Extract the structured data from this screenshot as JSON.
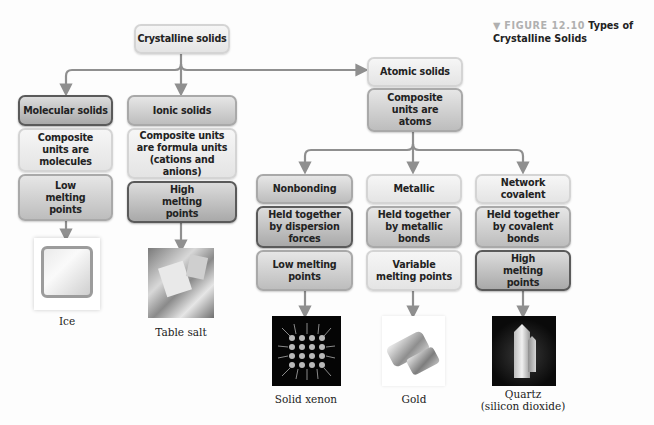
{
  "figure": {
    "marker": "▼",
    "number": "FIGURE 12.10",
    "title_line1": "Types of",
    "title_line2": "Crystalline Solids"
  },
  "root": {
    "label": "Crystalline solids"
  },
  "molecular": {
    "type": "Molecular solids",
    "units": "Composite units are molecules",
    "melting": "Low melting points",
    "example": "Ice"
  },
  "ionic": {
    "type": "Ionic solids",
    "units": "Composite units are formula units (cations and anions)",
    "melting": "High melting points",
    "example": "Table salt"
  },
  "atomic": {
    "type": "Atomic solids",
    "units": "Composite units are atoms",
    "subtypes": [
      {
        "type": "Nonbonding",
        "bond": "Held together by dispersion forces",
        "melting": "Low melting points",
        "example": "Solid xenon"
      },
      {
        "type": "Metallic",
        "bond": "Held together by metallic bonds",
        "melting": "Variable melting points",
        "example": "Gold"
      },
      {
        "type": "Network covalent",
        "bond": "Held together by covalent bonds",
        "melting": "High melting points",
        "example_line1": "Quartz",
        "example_line2": "(silicon dioxide)"
      }
    ]
  },
  "colors": {
    "connector": "#8f8f8f",
    "box_light": "#ececec",
    "box_dark_border": "#5a5a5a",
    "figure_number": "#b0b0b0"
  }
}
